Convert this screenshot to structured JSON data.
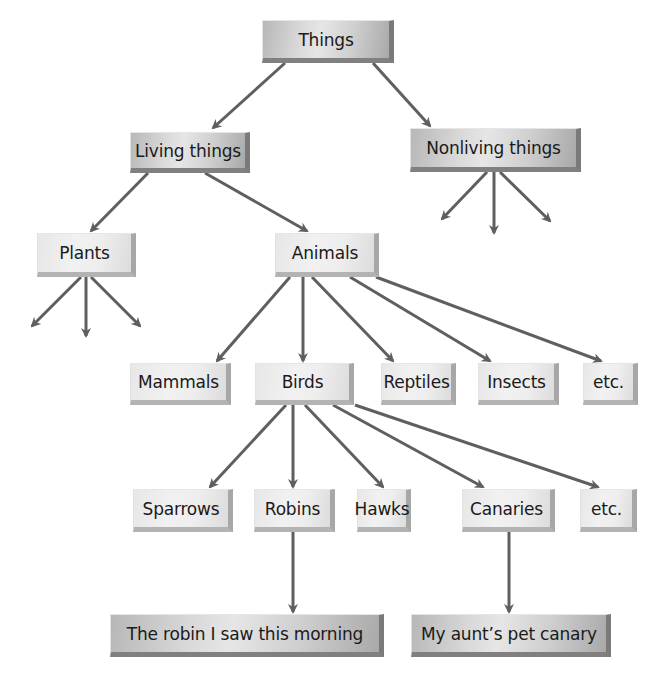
{
  "diagram": {
    "type": "hierarchy-tree",
    "nodes": {
      "things": {
        "label": "Things",
        "style": "dark",
        "x": 262,
        "y": 20,
        "w": 132,
        "h": 43
      },
      "living_things": {
        "label": "Living things",
        "style": "dark",
        "x": 130,
        "y": 132,
        "w": 120,
        "h": 41
      },
      "nonliving_things": {
        "label": "Nonliving things",
        "style": "dark",
        "x": 410,
        "y": 128,
        "w": 171,
        "h": 44
      },
      "plants": {
        "label": "Plants",
        "style": "light",
        "x": 37,
        "y": 233,
        "w": 99,
        "h": 44
      },
      "animals": {
        "label": "Animals",
        "style": "light",
        "x": 275,
        "y": 233,
        "w": 104,
        "h": 44
      },
      "mammals": {
        "label": "Mammals",
        "style": "light",
        "x": 130,
        "y": 363,
        "w": 101,
        "h": 42
      },
      "birds": {
        "label": "Birds",
        "style": "light",
        "x": 255,
        "y": 363,
        "w": 99,
        "h": 42
      },
      "reptiles": {
        "label": "Reptiles",
        "style": "light",
        "x": 381,
        "y": 363,
        "w": 75,
        "h": 42
      },
      "insects": {
        "label": "Insects",
        "style": "light",
        "x": 478,
        "y": 363,
        "w": 81,
        "h": 42
      },
      "etc_animals": {
        "label": "etc.",
        "style": "light",
        "x": 583,
        "y": 363,
        "w": 55,
        "h": 42
      },
      "sparrows": {
        "label": "Sparrows",
        "style": "light",
        "x": 133,
        "y": 489,
        "w": 100,
        "h": 43
      },
      "robins": {
        "label": "Robins",
        "style": "light",
        "x": 254,
        "y": 489,
        "w": 81,
        "h": 43
      },
      "hawks": {
        "label": "Hawks",
        "style": "light",
        "x": 357,
        "y": 489,
        "w": 54,
        "h": 43
      },
      "canaries": {
        "label": "Canaries",
        "style": "light",
        "x": 462,
        "y": 489,
        "w": 93,
        "h": 43
      },
      "etc_birds": {
        "label": "etc.",
        "style": "light",
        "x": 580,
        "y": 489,
        "w": 57,
        "h": 43
      },
      "robin_this_morning": {
        "label": "The robin I saw this morning",
        "style": "dark",
        "x": 110,
        "y": 614,
        "w": 274,
        "h": 43
      },
      "aunts_pet_canary": {
        "label": "My aunt’s pet canary",
        "style": "dark",
        "x": 411,
        "y": 614,
        "w": 200,
        "h": 43
      }
    },
    "edges": [
      {
        "from": "things",
        "to": "living_things",
        "x1": 285,
        "y1": 63,
        "x2": 213,
        "y2": 128
      },
      {
        "from": "things",
        "to": "nonliving_things",
        "x1": 373,
        "y1": 63,
        "x2": 430,
        "y2": 126
      },
      {
        "from": "nonliving_things",
        "to": "unlabeled",
        "x1": 487,
        "y1": 172,
        "x2": 442,
        "y2": 219
      },
      {
        "from": "nonliving_things",
        "to": "unlabeled",
        "x1": 494,
        "y1": 172,
        "x2": 494,
        "y2": 233
      },
      {
        "from": "nonliving_things",
        "to": "unlabeled",
        "x1": 500,
        "y1": 172,
        "x2": 550,
        "y2": 221
      },
      {
        "from": "living_things",
        "to": "plants",
        "x1": 148,
        "y1": 173,
        "x2": 91,
        "y2": 231
      },
      {
        "from": "living_things",
        "to": "animals",
        "x1": 205,
        "y1": 173,
        "x2": 307,
        "y2": 231
      },
      {
        "from": "plants",
        "to": "unlabeled",
        "x1": 81,
        "y1": 277,
        "x2": 32,
        "y2": 326
      },
      {
        "from": "plants",
        "to": "unlabeled",
        "x1": 86,
        "y1": 277,
        "x2": 86,
        "y2": 336
      },
      {
        "from": "plants",
        "to": "unlabeled",
        "x1": 91,
        "y1": 277,
        "x2": 140,
        "y2": 326
      },
      {
        "from": "animals",
        "to": "mammals",
        "x1": 290,
        "y1": 277,
        "x2": 217,
        "y2": 361
      },
      {
        "from": "animals",
        "to": "birds",
        "x1": 303,
        "y1": 277,
        "x2": 303,
        "y2": 361
      },
      {
        "from": "animals",
        "to": "reptiles",
        "x1": 312,
        "y1": 277,
        "x2": 393,
        "y2": 361
      },
      {
        "from": "animals",
        "to": "insects",
        "x1": 350,
        "y1": 277,
        "x2": 490,
        "y2": 361
      },
      {
        "from": "animals",
        "to": "etc_animals",
        "x1": 376,
        "y1": 277,
        "x2": 601,
        "y2": 361
      },
      {
        "from": "birds",
        "to": "sparrows",
        "x1": 286,
        "y1": 405,
        "x2": 210,
        "y2": 487
      },
      {
        "from": "birds",
        "to": "robins",
        "x1": 293,
        "y1": 405,
        "x2": 293,
        "y2": 487
      },
      {
        "from": "birds",
        "to": "hawks",
        "x1": 305,
        "y1": 405,
        "x2": 383,
        "y2": 487
      },
      {
        "from": "birds",
        "to": "canaries",
        "x1": 333,
        "y1": 405,
        "x2": 483,
        "y2": 487
      },
      {
        "from": "birds",
        "to": "etc_birds",
        "x1": 355,
        "y1": 405,
        "x2": 598,
        "y2": 487
      },
      {
        "from": "robins",
        "to": "robin_this_morning",
        "x1": 293,
        "y1": 532,
        "x2": 293,
        "y2": 612
      },
      {
        "from": "canaries",
        "to": "aunts_pet_canary",
        "x1": 509,
        "y1": 532,
        "x2": 509,
        "y2": 612
      }
    ],
    "colors": {
      "arrow": "#5f5f5f",
      "text": "#1a1a1a",
      "background": "#ffffff"
    }
  }
}
